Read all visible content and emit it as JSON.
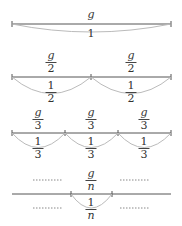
{
  "diagram": {
    "colors": {
      "line": "#555555",
      "arc": "#bbbbbb",
      "dots": "#888888"
    },
    "rows": [
      {
        "name": "whole",
        "top_label": "g",
        "bottom_label": "1"
      },
      {
        "name": "halves",
        "segments": [
          {
            "top": {
              "num": "g",
              "den": "2"
            },
            "bottom": {
              "num": "1",
              "den": "2"
            }
          },
          {
            "top": {
              "num": "g",
              "den": "2"
            },
            "bottom": {
              "num": "1",
              "den": "2"
            }
          }
        ]
      },
      {
        "name": "thirds",
        "segments": [
          {
            "top": {
              "num": "g",
              "den": "3"
            },
            "bottom": {
              "num": "1",
              "den": "3"
            }
          },
          {
            "top": {
              "num": "g",
              "den": "3"
            },
            "bottom": {
              "num": "1",
              "den": "3"
            }
          },
          {
            "top": {
              "num": "g",
              "den": "3"
            },
            "bottom": {
              "num": "1",
              "den": "3"
            }
          }
        ]
      },
      {
        "name": "nths",
        "top": {
          "num": "g",
          "den": "n"
        },
        "bottom": {
          "num": "1",
          "den": "n"
        },
        "ellipsis": "………"
      }
    ]
  }
}
